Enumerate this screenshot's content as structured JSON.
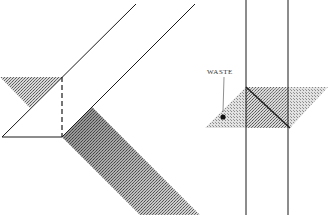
{
  "figure": {
    "labels": {
      "waste": "WASTE"
    },
    "colors": {
      "line": "#1a1a1a",
      "shade_dark": "#6a6a6a",
      "shade_light": "#b0b0b0",
      "background": "#ffffff"
    }
  }
}
